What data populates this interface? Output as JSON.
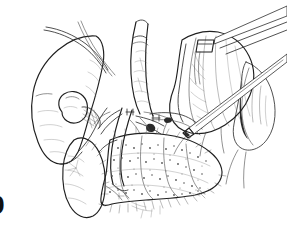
{
  "figure": {
    "domain": "medical-surgical-line-illustration",
    "label": "9",
    "label_note": "bold figure label cropped at left edge",
    "canvas": {
      "width": 287,
      "height": 233,
      "background": "#ffffff"
    },
    "style": {
      "technique": "pen-and-ink line drawing with stipple and hatching",
      "ink_color": "#2b2b2b",
      "outline_color": "#1f1f1f",
      "hatch_color": "#5c5c5c",
      "stipple_color": "#555555",
      "shadow_color": "#2a2a2a",
      "has_color": false,
      "has_gridlines": false
    },
    "structures": [
      {
        "name": "liver",
        "label": "liver left lobe",
        "region": "left",
        "texture": "smooth outline with soft edge hatching"
      },
      {
        "name": "gallbladder",
        "label": "gallbladder fundus",
        "region": "left-center",
        "texture": "rounded ovoid with cross-hatched neck"
      },
      {
        "name": "cystic-duct-stump",
        "label": "cystic duct stump",
        "region": "left-center",
        "texture": "cross-hatched ligature patch"
      },
      {
        "name": "common-bile-duct",
        "label": "common bile duct",
        "region": "center",
        "texture": "vertical tubular structure with tie"
      },
      {
        "name": "portal-vein",
        "label": "portal vein",
        "region": "center",
        "texture": "broad vessel trunk"
      },
      {
        "name": "hepatic-artery",
        "label": "hepatic artery branches",
        "region": "center",
        "texture": "branching vessels with surgical clips"
      },
      {
        "name": "duodenum",
        "label": "duodenum",
        "region": "lower-left-center",
        "texture": "tubular loop with serosal hatching"
      },
      {
        "name": "pancreas",
        "label": "pancreas head and body",
        "region": "lower-center",
        "texture": "lobulated stippled gland with spiked border"
      },
      {
        "name": "stomach",
        "label": "stomach / omentum mass",
        "region": "right",
        "texture": "large fold with fine contour hatching"
      },
      {
        "name": "retracted-organ",
        "label": "retracted organ edge",
        "region": "far-right",
        "texture": "rounded boundary with dark shading"
      }
    ],
    "instruments": [
      {
        "name": "retractor-blade",
        "label": "retractor blade",
        "entry": "top-right corner",
        "orientation": "descending to the left"
      },
      {
        "name": "dissector-probe",
        "label": "dissector probe",
        "entry": "right edge",
        "orientation": "diagonal toward center"
      },
      {
        "name": "traction-suture",
        "label": "traction suture",
        "entry": "upper-left over liver edge",
        "orientation": "looping band"
      }
    ],
    "annotations": {
      "text_labels": [],
      "leader_lines": 0
    }
  }
}
